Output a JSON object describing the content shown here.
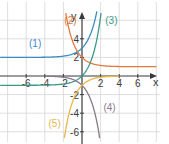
{
  "chart_data": {
    "type": "line",
    "title": "",
    "xlabel": "x",
    "ylabel": "y",
    "xlim": [
      -8.8,
      8
    ],
    "ylim": [
      -6.8,
      6.8
    ],
    "grid": true,
    "grid_step": 2,
    "x_ticks": [
      -6,
      -4,
      -2,
      2,
      4,
      6
    ],
    "y_ticks": [
      4,
      2,
      -2,
      -4,
      -6
    ],
    "x_tick_labels": [
      "-6",
      "-4",
      "-2",
      "2",
      "4",
      "6"
    ],
    "y_tick_labels": [
      "4",
      "2",
      "-2",
      "-4",
      "-6"
    ],
    "legend": "inline labels",
    "series": [
      {
        "name": "(1)",
        "formula": "2+e^x",
        "color": "#3a8cc6",
        "asymptote": 2,
        "label_pos": [
          -5.7,
          3.1
        ],
        "points": [
          [
            -8.8,
            2.0
          ],
          [
            -4,
            2.02
          ],
          [
            -2,
            2.14
          ],
          [
            -1,
            2.37
          ],
          [
            0,
            3.0
          ],
          [
            1,
            4.72
          ],
          [
            1.5,
            6.48
          ],
          [
            1.6,
            6.95
          ]
        ]
      },
      {
        "name": "(2)",
        "formula": "1+e^(-x)",
        "color": "#e07a3c",
        "asymptote": 1,
        "label_pos": [
          -1.9,
          5.6
        ],
        "points": [
          [
            -1.75,
            6.75
          ],
          [
            -1,
            3.72
          ],
          [
            0,
            2.0
          ],
          [
            1,
            1.37
          ],
          [
            2,
            1.14
          ],
          [
            4,
            1.02
          ],
          [
            8,
            1.0
          ]
        ]
      },
      {
        "name": "(3)",
        "formula": "e^x-1",
        "color": "#3a9a8a",
        "asymptote": -1,
        "label_pos": [
          2.5,
          5.6
        ],
        "points": [
          [
            -8.8,
            -1.0
          ],
          [
            -4,
            -0.98
          ],
          [
            -2,
            -0.86
          ],
          [
            -1,
            -0.63
          ],
          [
            0,
            0.0
          ],
          [
            1,
            1.72
          ],
          [
            1.5,
            3.48
          ],
          [
            2,
            6.39
          ],
          [
            2.05,
            6.77
          ]
        ]
      },
      {
        "name": "(4)",
        "formula": "-e^x",
        "color": "#8a7a8c",
        "asymptote": 0,
        "label_pos": [
          2.3,
          -3.8
        ],
        "points": [
          [
            -4,
            -0.02
          ],
          [
            -2,
            -0.14
          ],
          [
            -1,
            -0.37
          ],
          [
            0,
            -1.0
          ],
          [
            1,
            -2.72
          ],
          [
            1.5,
            -4.48
          ],
          [
            1.9,
            -6.69
          ]
        ]
      },
      {
        "name": "(5)",
        "formula": "-e^(-x)",
        "color": "#e8b84a",
        "asymptote": 0,
        "label_pos": [
          -3.6,
          -5.5
        ],
        "points": [
          [
            -1.9,
            -6.69
          ],
          [
            -1.5,
            -4.48
          ],
          [
            -1,
            -2.72
          ],
          [
            0,
            -1.0
          ],
          [
            1,
            -0.37
          ],
          [
            2,
            -0.14
          ],
          [
            4,
            -0.02
          ]
        ]
      }
    ]
  }
}
